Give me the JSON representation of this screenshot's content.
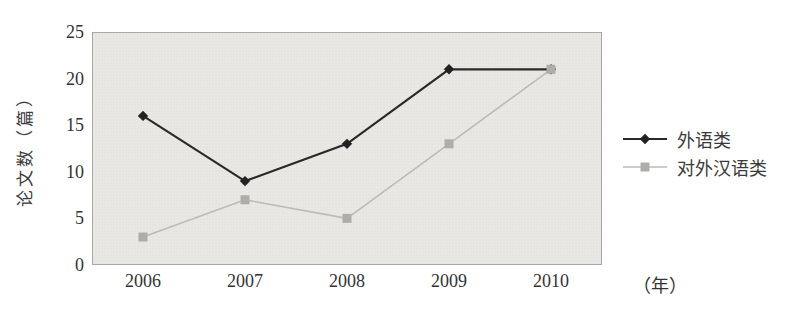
{
  "chart_data": {
    "type": "line",
    "title": "",
    "categories": [
      "2006",
      "2007",
      "2008",
      "2009",
      "2010"
    ],
    "series": [
      {
        "name": "外语类",
        "values": [
          16,
          9,
          13,
          21,
          21
        ],
        "color": "#2a2a2a",
        "marker": "diamond",
        "marker_color": "#222222",
        "line_width": 2.2
      },
      {
        "name": "对外汉语类",
        "values": [
          3,
          7,
          5,
          13,
          21
        ],
        "color": "#bcbbb8",
        "marker": "square",
        "marker_color": "#aeadaa",
        "line_width": 1.6
      }
    ],
    "xlabel": "（年）",
    "ylabel": "论文数（篇）",
    "ylim": [
      0,
      25
    ],
    "yticks": [
      0,
      5,
      10,
      15,
      20,
      25
    ],
    "grid": false,
    "legend_position": "right",
    "plot_background": "#e9e8e5",
    "plot_border_color": "#a9a8a5",
    "halftone_dot_color": "#d9d8d4"
  }
}
